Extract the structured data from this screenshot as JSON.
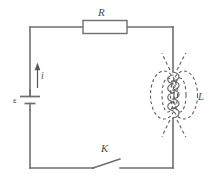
{
  "diagram": {
    "labels": {
      "resistor": "R",
      "current": "i",
      "emf": "ε",
      "inductor": "L",
      "switch": "K"
    },
    "colors": {
      "wire": "#6f6f6f",
      "field_line": "#5f5f5f",
      "label": "#4a4a4a",
      "background": "#ffffff"
    },
    "components": [
      {
        "name": "resistor",
        "symbol": "rectangle",
        "label": "R",
        "position": "top-branch",
        "state": "in-series"
      },
      {
        "name": "battery",
        "symbol": "cell-plates",
        "label": "ε",
        "position": "left-branch",
        "state": "source"
      },
      {
        "name": "current-arrow",
        "symbol": "arrow-up",
        "label": "i",
        "position": "left-branch",
        "direction": "upward"
      },
      {
        "name": "inductor",
        "symbol": "solenoid-with-field-lines",
        "label": "L",
        "position": "right-branch",
        "state": "energized"
      },
      {
        "name": "switch",
        "symbol": "knife-switch",
        "label": "K",
        "position": "bottom-branch",
        "state": "open"
      }
    ]
  }
}
